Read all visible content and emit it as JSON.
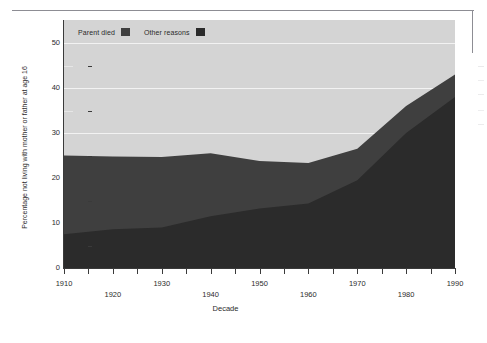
{
  "chart_data": {
    "type": "area",
    "stacked": true,
    "title": "",
    "xlabel": "Decade",
    "ylabel": "Percentage not living with mother or father at age 16",
    "categories": [
      1910,
      1920,
      1930,
      1940,
      1950,
      1960,
      1970,
      1980,
      1990
    ],
    "x_tick_labels": [
      "1910",
      "1920",
      "1930",
      "1940",
      "1950",
      "1960",
      "1970",
      "1980",
      "1990"
    ],
    "y_tick_labels": [
      "0",
      "10",
      "20",
      "30",
      "40",
      "50"
    ],
    "y_tick_values": [
      0,
      10,
      20,
      30,
      40,
      50
    ],
    "y_minor_tick_values": [
      5,
      15,
      25,
      35,
      45
    ],
    "ylim": [
      0,
      50
    ],
    "xlim": [
      1910,
      1990
    ],
    "grid": true,
    "legend_position": "top-left",
    "series": [
      {
        "name": "Other reasons",
        "color": "#2b2b2b",
        "values": [
          7.5,
          8.6,
          9.0,
          11.5,
          13.2,
          14.3,
          19.5,
          30.0,
          38.0
        ]
      },
      {
        "name": "Parent died",
        "color": "#3f3f3f",
        "values": [
          17.5,
          16.2,
          15.7,
          14.0,
          10.6,
          9.0,
          7.0,
          6.0,
          5.0
        ]
      }
    ],
    "totals": [
      25.0,
      24.8,
      24.7,
      25.5,
      23.8,
      23.3,
      26.5,
      36.0,
      43.0
    ],
    "colors": {
      "plot_background": "#d4d4d4",
      "gridline": "#f2f2f2",
      "axis": "#3a3a3a",
      "page_background": "#ffffff"
    }
  },
  "legend": {
    "entries": [
      {
        "label": "Parent died",
        "swatch_color": "#3f3f3f"
      },
      {
        "label": "Other reasons",
        "swatch_color": "#2b2b2b"
      }
    ]
  },
  "axes": {
    "y_title": "Percentage not living with mother or father at age 16",
    "x_title": "Decade"
  }
}
